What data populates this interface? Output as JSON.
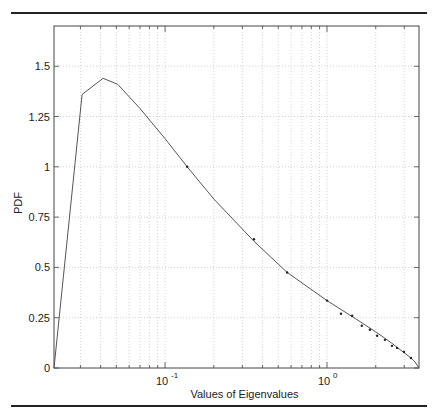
{
  "chart_data": {
    "type": "line",
    "title": "",
    "xlabel": "Values of Eigenvalues",
    "ylabel": "PDF",
    "xscale": "log",
    "xlim": [
      0.0206,
      3.7
    ],
    "ylim": [
      0,
      1.7
    ],
    "grid": true,
    "legend": null,
    "x_tick_labels": [
      {
        "base": "10",
        "exp": "-1",
        "value": 0.1
      },
      {
        "base": "10",
        "exp": "0",
        "value": 1
      }
    ],
    "y_tick_labels": [
      "0",
      "0.25",
      "0.5",
      "0.75",
      "1",
      "1.25",
      "1.5"
    ],
    "series": [
      {
        "name": "theoretical PDF (line)",
        "style": "line",
        "color": "#555555",
        "x": [
          0.0206,
          0.0307,
          0.0414,
          0.051,
          0.07,
          0.1,
          0.137,
          0.2,
          0.354,
          0.567,
          1.0,
          1.5,
          2.0,
          2.5,
          3.0,
          3.3,
          3.5,
          3.7
        ],
        "y": [
          0.0,
          1.36,
          1.44,
          1.41,
          1.29,
          1.14,
          1.0,
          0.84,
          0.63,
          0.475,
          0.335,
          0.245,
          0.18,
          0.125,
          0.075,
          0.05,
          0.03,
          0.0
        ]
      },
      {
        "name": "empirical (markers)",
        "style": "markers",
        "color": "#222222",
        "x": [
          0.137,
          0.354,
          0.567,
          1.0,
          1.22,
          1.43,
          1.64,
          1.84,
          2.04,
          2.28,
          2.52,
          2.71,
          2.99,
          3.3
        ],
        "y": [
          1.0,
          0.64,
          0.475,
          0.335,
          0.27,
          0.26,
          0.21,
          0.19,
          0.16,
          0.14,
          0.11,
          0.1,
          0.08,
          0.05
        ]
      }
    ]
  }
}
